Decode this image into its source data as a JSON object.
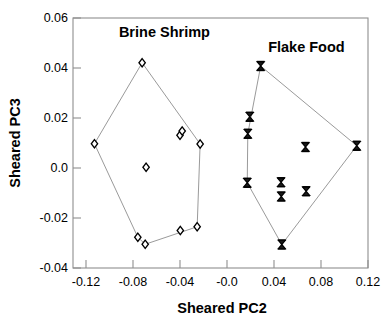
{
  "chart_data": {
    "type": "scatter",
    "title": "",
    "xlabel": "Sheared PC2",
    "ylabel": "Sheared PC3",
    "xlim": [
      -0.14,
      0.128
    ],
    "ylim": [
      -0.04,
      0.06
    ],
    "xticks": [
      -0.12,
      -0.08,
      -0.04,
      -0.0,
      0.04,
      0.08,
      0.12
    ],
    "xticklabels": [
      "-0.12",
      "-0.08",
      "-0.04",
      "-0.0",
      "0.04",
      "0.08",
      "0.12"
    ],
    "yticks": [
      -0.04,
      -0.02,
      0.0,
      0.02,
      0.04,
      0.06
    ],
    "yticklabels": [
      "-0.04",
      "-0.02",
      "0.0",
      "0.02",
      "0.04",
      "0.06"
    ],
    "grid": false,
    "legend_position": "inline-annotation",
    "annotations": [
      {
        "text": "Brine Shrimp",
        "x": -0.057,
        "y": 0.0525,
        "anchor": "middle"
      },
      {
        "text": "Flake Food",
        "x": 0.072,
        "y": 0.0465,
        "anchor": "middle"
      }
    ],
    "series": [
      {
        "name": "Brine Shrimp",
        "marker": "open-diamond",
        "color": "#000000",
        "hull": true,
        "points": [
          {
            "x": -0.1205,
            "y": 0.0097
          },
          {
            "x": -0.0772,
            "y": 0.0421
          },
          {
            "x": -0.0428,
            "y": 0.0131
          },
          {
            "x": -0.0408,
            "y": 0.0148
          },
          {
            "x": -0.0245,
            "y": 0.0096
          },
          {
            "x": -0.0736,
            "y": 0.0003
          },
          {
            "x": -0.0811,
            "y": -0.0277
          },
          {
            "x": -0.0744,
            "y": -0.0305
          },
          {
            "x": -0.0425,
            "y": -0.025
          },
          {
            "x": -0.0272,
            "y": -0.0235
          }
        ],
        "hull_order": [
          0,
          1,
          4,
          9,
          7,
          6
        ]
      },
      {
        "name": "Flake Food",
        "marker": "bowtie",
        "color": "#000000",
        "hull": true,
        "points": [
          {
            "x": 0.0305,
            "y": 0.0408
          },
          {
            "x": 0.0206,
            "y": 0.0205
          },
          {
            "x": 0.0188,
            "y": 0.0137
          },
          {
            "x": 0.0183,
            "y": -0.0059
          },
          {
            "x": 0.049,
            "y": -0.0057
          },
          {
            "x": 0.0492,
            "y": -0.0114
          },
          {
            "x": 0.0712,
            "y": 0.0084
          },
          {
            "x": 0.0718,
            "y": -0.0093
          },
          {
            "x": 0.0497,
            "y": -0.0306
          },
          {
            "x": 0.1178,
            "y": 0.0089
          }
        ],
        "hull_order": [
          0,
          9,
          8,
          3,
          2
        ]
      }
    ]
  },
  "figure": {
    "background_color": "#ffffff",
    "axis_color": "#8a8a8a",
    "hull_line_color": "#9a9a9a",
    "marker_color": "#000000"
  }
}
